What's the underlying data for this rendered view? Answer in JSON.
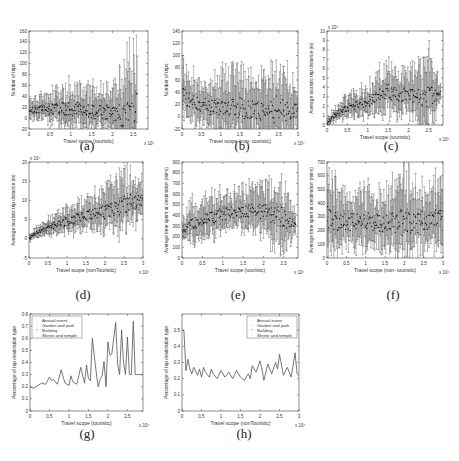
{
  "figure": {
    "panels": [
      {
        "id": "a",
        "caption": "(a)",
        "xlabel": "Travel scope (touristic)",
        "ylabel": "Number of trips",
        "xscale": "x 10⁴",
        "yscale": ""
      },
      {
        "id": "b",
        "caption": "(b)",
        "xlabel": "Travel scope (non- touristic)",
        "ylabel": "Number of trips",
        "xscale": "x 10⁴",
        "yscale": ""
      },
      {
        "id": "c",
        "caption": "(c)",
        "xlabel": "Travel scope (touristic)",
        "ylabel": "Average touristic trip distance (m)",
        "xscale": "x 10⁴",
        "yscale": "x 10⁴"
      },
      {
        "id": "d",
        "caption": "(d)",
        "xlabel": "Travel scope (nonTouristic)",
        "ylabel": "Average touristic trip distance (m)",
        "xscale": "x 10⁴",
        "yscale": "x 10⁴"
      },
      {
        "id": "e",
        "caption": "(e)",
        "xlabel": "Travel scope (touristic)",
        "ylabel": "Average time spent at destination (mins)",
        "xscale": "x 10⁴",
        "yscale": ""
      },
      {
        "id": "f",
        "caption": "(f)",
        "xlabel": "Travel scope (non- touristic)",
        "ylabel": "Average time spent at destination (mins)",
        "xscale": "x 10⁴",
        "yscale": ""
      },
      {
        "id": "g",
        "caption": "(g)",
        "xlabel": "Travel scope (touristic)",
        "ylabel": "Percentage of top destination type",
        "xscale": "x 10⁴",
        "yscale": ""
      },
      {
        "id": "h",
        "caption": "(h)",
        "xlabel": "Travel scope (nonTouristic)",
        "ylabel": "Percentage of top destination type",
        "xscale": "x 10⁴",
        "yscale": ""
      }
    ],
    "legend": [
      "Annual event",
      "Garden and park",
      "Building",
      "Shrine and temple"
    ],
    "colors": {
      "line": "#555555",
      "axis": "#444444",
      "errorbar": "#3a3a3a",
      "mean": "#111111"
    }
  },
  "chart_data": [
    {
      "panel": "a",
      "type": "scatter",
      "title": "",
      "xlabel": "Travel scope (touristic)",
      "ylabel": "Number of trips",
      "xlim": [
        0,
        2.85
      ],
      "ylim": [
        -20,
        160
      ],
      "xticks": [
        0,
        0.5,
        1,
        1.5,
        2,
        2.5
      ],
      "yticks": [
        -20,
        0,
        20,
        40,
        60,
        80,
        100,
        120,
        140,
        160
      ],
      "x_multiplier": "x 10^4",
      "trend": {
        "x": [
          0,
          0.5,
          1,
          1.5,
          2,
          2.2,
          2.5,
          2.6
        ],
        "mean": [
          15,
          16,
          18,
          12,
          10,
          8,
          8,
          50
        ],
        "upper": [
          38,
          50,
          70,
          65,
          60,
          110,
          150,
          148
        ]
      },
      "errorbars": true
    },
    {
      "panel": "b",
      "type": "scatter",
      "title": "",
      "xlabel": "Travel scope (non- touristic)",
      "ylabel": "Number of trips",
      "xlim": [
        0,
        3
      ],
      "ylim": [
        -20,
        140
      ],
      "xticks": [
        0,
        0.5,
        1,
        1.5,
        2,
        2.5,
        3
      ],
      "yticks": [
        -20,
        0,
        20,
        40,
        60,
        80,
        100,
        120,
        140
      ],
      "x_multiplier": "x 10^4",
      "trend": {
        "x": [
          0,
          0.1,
          0.5,
          1,
          1.5,
          2,
          2.5,
          3
        ],
        "mean": [
          35,
          30,
          18,
          17,
          15,
          12,
          12,
          12
        ],
        "upper": [
          105,
          80,
          65,
          85,
          90,
          80,
          110,
          60
        ]
      },
      "errorbars": true
    },
    {
      "panel": "c",
      "type": "scatter",
      "title": "",
      "xlabel": "Travel scope (touristic)",
      "ylabel": "Average touristic trip distance (m)",
      "xlim": [
        0,
        2.85
      ],
      "ylim": [
        0,
        10
      ],
      "xticks": [
        0,
        0.5,
        1,
        1.5,
        2,
        2.5
      ],
      "yticks": [
        0,
        1,
        2,
        3,
        4,
        5,
        6,
        7,
        8,
        9,
        10
      ],
      "x_multiplier": "x 10^4",
      "y_multiplier": "x 10^4",
      "trend": {
        "x": [
          0,
          0.25,
          0.5,
          1,
          1.5,
          2,
          2.5,
          2.8
        ],
        "mean": [
          0.2,
          1.2,
          1.8,
          2.5,
          3.5,
          3.2,
          3.0,
          3.5
        ],
        "upper": [
          0.8,
          2.2,
          3.5,
          4.5,
          7.0,
          6.0,
          8.8,
          4.5
        ]
      },
      "errorbars": true
    },
    {
      "panel": "d",
      "type": "scatter",
      "title": "",
      "xlabel": "Travel scope (nonTouristic)",
      "ylabel": "Average touristic trip distance (m)",
      "xlim": [
        0,
        3
      ],
      "ylim": [
        -5,
        20
      ],
      "xticks": [
        0,
        0.5,
        1,
        1.5,
        2,
        2.5,
        3
      ],
      "yticks": [
        -5,
        0,
        5,
        10,
        15,
        20
      ],
      "x_multiplier": "x 10^4",
      "y_multiplier": "x 10^4",
      "trend": {
        "x": [
          0,
          0.25,
          0.5,
          1,
          1.5,
          2,
          2.5,
          3
        ],
        "mean": [
          0,
          2,
          3,
          4.5,
          6,
          7,
          9,
          10
        ],
        "upper": [
          1,
          4,
          6,
          9,
          11,
          14,
          19,
          16
        ]
      },
      "errorbars": true
    },
    {
      "panel": "e",
      "type": "scatter",
      "title": "",
      "xlabel": "Travel scope (touristic)",
      "ylabel": "Average time spent at destination (mins)",
      "xlim": [
        0,
        2.85
      ],
      "ylim": [
        0,
        900
      ],
      "xticks": [
        0,
        0.5,
        1,
        1.5,
        2,
        2.5
      ],
      "yticks": [
        0,
        100,
        200,
        300,
        400,
        500,
        600,
        700,
        800,
        900
      ],
      "x_multiplier": "x 10^4",
      "trend": {
        "x": [
          0,
          0.25,
          0.5,
          1,
          1.5,
          2,
          2.5,
          2.8
        ],
        "mean": [
          240,
          320,
          360,
          410,
          450,
          440,
          380,
          300
        ],
        "upper": [
          380,
          560,
          600,
          650,
          700,
          750,
          800,
          420
        ]
      },
      "errorbars": true
    },
    {
      "panel": "f",
      "type": "scatter",
      "title": "",
      "xlabel": "Travel scope (non- touristic)",
      "ylabel": "Average time spent at destination (mins)",
      "xlim": [
        0,
        3
      ],
      "ylim": [
        0,
        700
      ],
      "xticks": [
        0,
        0.5,
        1,
        1.5,
        2,
        2.5,
        3
      ],
      "yticks": [
        0,
        100,
        200,
        300,
        400,
        500,
        600,
        700
      ],
      "x_multiplier": "x 10^4",
      "trend": {
        "x": [
          0,
          0.5,
          1,
          1.5,
          2,
          2.5,
          3
        ],
        "mean": [
          280,
          260,
          270,
          250,
          260,
          270,
          300
        ],
        "upper": [
          680,
          500,
          560,
          500,
          660,
          560,
          620
        ]
      },
      "errorbars": true
    },
    {
      "panel": "g",
      "type": "line",
      "title": "",
      "xlabel": "Travel scope (touristic)",
      "ylabel": "Percentage of top destination type",
      "xlim": [
        0,
        2.9
      ],
      "ylim": [
        0,
        0.8
      ],
      "xticks": [
        0,
        0.5,
        1,
        1.5,
        2,
        2.5
      ],
      "yticks": [
        0,
        0.1,
        0.2,
        0.3,
        0.4,
        0.5,
        0.6,
        0.7,
        0.8
      ],
      "x_multiplier": "x 10^4",
      "legend": [
        "Annual event",
        "Garden and park",
        "Building",
        "Shrine and temple"
      ],
      "legend_position": "upper left",
      "x": [
        0,
        0.1,
        0.2,
        0.3,
        0.4,
        0.5,
        0.55,
        0.6,
        0.7,
        0.8,
        0.85,
        0.9,
        1.0,
        1.05,
        1.1,
        1.2,
        1.3,
        1.4,
        1.45,
        1.5,
        1.55,
        1.6,
        1.7,
        1.75,
        1.8,
        1.85,
        1.9,
        1.95,
        2.0,
        2.05,
        2.1,
        2.2,
        2.25,
        2.3,
        2.35,
        2.4,
        2.45,
        2.5,
        2.55,
        2.6,
        2.65,
        2.7,
        2.75,
        2.8,
        2.85,
        2.9
      ],
      "values": [
        0.2,
        0.19,
        0.21,
        0.23,
        0.22,
        0.28,
        0.25,
        0.26,
        0.22,
        0.34,
        0.28,
        0.23,
        0.21,
        0.29,
        0.24,
        0.22,
        0.36,
        0.23,
        0.38,
        0.27,
        0.25,
        0.6,
        0.32,
        0.2,
        0.26,
        0.29,
        0.41,
        0.2,
        0.57,
        0.46,
        0.47,
        0.73,
        0.38,
        0.3,
        0.67,
        0.4,
        0.3,
        0.61,
        0.3,
        0.3,
        0.74,
        0.3,
        0.3,
        0.3,
        0.3,
        0.3
      ]
    },
    {
      "panel": "h",
      "type": "line",
      "title": "",
      "xlabel": "Travel scope (nonTouristic)",
      "ylabel": "Percentage of top destination type",
      "xlim": [
        0,
        3
      ],
      "ylim": [
        0,
        0.6
      ],
      "xticks": [
        0,
        0.5,
        1,
        1.5,
        2,
        2.5,
        3
      ],
      "yticks": [
        0,
        0.1,
        0.2,
        0.3,
        0.4,
        0.5
      ],
      "x_multiplier": "x 10^4",
      "legend": [
        "Annual event",
        "Garden and park",
        "Building",
        "Shrine and temple"
      ],
      "legend_position": "upper right",
      "x": [
        0,
        0.05,
        0.1,
        0.15,
        0.2,
        0.25,
        0.3,
        0.4,
        0.45,
        0.5,
        0.55,
        0.6,
        0.7,
        0.75,
        0.8,
        0.9,
        1.0,
        1.1,
        1.2,
        1.3,
        1.4,
        1.5,
        1.6,
        1.7,
        1.75,
        1.8,
        1.9,
        2.0,
        2.05,
        2.1,
        2.2,
        2.3,
        2.4,
        2.45,
        2.5,
        2.6,
        2.7,
        2.8,
        2.9,
        2.95,
        3.0
      ],
      "values": [
        0.5,
        0.5,
        0.25,
        0.32,
        0.26,
        0.23,
        0.27,
        0.22,
        0.26,
        0.21,
        0.27,
        0.24,
        0.21,
        0.26,
        0.23,
        0.2,
        0.25,
        0.21,
        0.24,
        0.2,
        0.25,
        0.21,
        0.19,
        0.23,
        0.2,
        0.28,
        0.24,
        0.31,
        0.26,
        0.19,
        0.29,
        0.23,
        0.3,
        0.26,
        0.35,
        0.22,
        0.27,
        0.21,
        0.36,
        0.23,
        0.22
      ]
    }
  ]
}
